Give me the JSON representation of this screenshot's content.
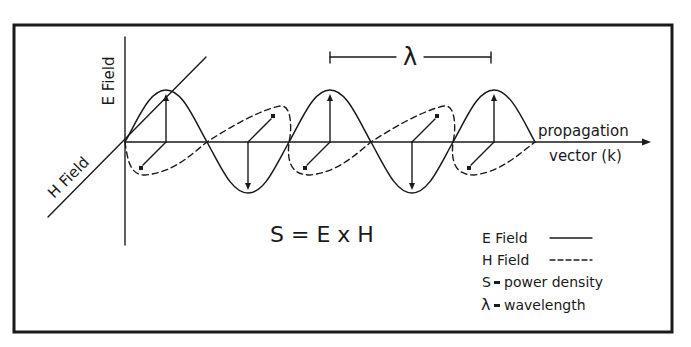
{
  "diagram": {
    "axes": {
      "e_axis_label": "E Field",
      "h_axis_label": "H Field",
      "propagation_label_line1": "propagation",
      "propagation_label_line2": "vector (k)"
    },
    "wavelength_marker": {
      "symbol": "λ"
    },
    "equation": "S = E x H",
    "legend": [
      {
        "key": "E Field",
        "sample": "solid",
        "text": "E Field"
      },
      {
        "key": "H Field",
        "sample": "dashed",
        "text": "H Field"
      },
      {
        "key": "S",
        "text": "S ▬ power density",
        "symbol": "S",
        "desc": "power density"
      },
      {
        "key": "λ",
        "text": "λ ▬ wavelength",
        "symbol": "λ",
        "desc": "wavelength"
      }
    ],
    "colors": {
      "ink": "#1a1a1a",
      "background": "#ffffff"
    }
  }
}
